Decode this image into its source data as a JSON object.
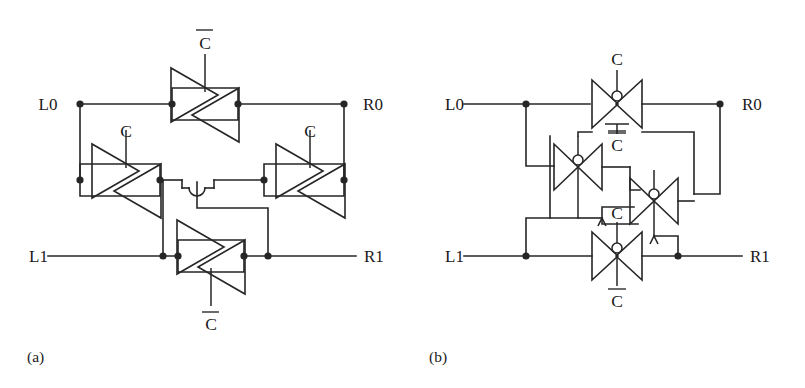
{
  "figure": {
    "kind": "circuit-schematic",
    "panels": [
      {
        "id": "a",
        "caption": "(a)",
        "style": "tri-state-buffer-pairs",
        "terminals": {
          "left_top": "L0",
          "right_top": "R0",
          "left_bottom": "L1",
          "right_bottom": "R1"
        },
        "devices": [
          {
            "id": "a-top",
            "control": "C̅",
            "control_plain": "Cbar",
            "position": "top-horizontal",
            "type": "back-to-back-tristate-buffers"
          },
          {
            "id": "a-left",
            "control": "C",
            "control_plain": "C",
            "position": "middle-left",
            "type": "back-to-back-tristate-buffers"
          },
          {
            "id": "a-right",
            "control": "C",
            "control_plain": "C",
            "position": "middle-right",
            "type": "back-to-back-tristate-buffers"
          },
          {
            "id": "a-bottom",
            "control": "C̅",
            "control_plain": "Cbar",
            "position": "bottom-horizontal",
            "type": "back-to-back-tristate-buffers"
          }
        ]
      },
      {
        "id": "b",
        "caption": "(b)",
        "style": "transmission-gates",
        "terminals": {
          "left_top": "L0",
          "right_top": "R0",
          "left_bottom": "L1",
          "right_bottom": "R1"
        },
        "devices": [
          {
            "id": "b-top",
            "control_top": "C",
            "control_bottom": "C̅",
            "position": "top-horizontal",
            "type": "cmos-transmission-gate"
          },
          {
            "id": "b-left",
            "control_top": "C̅",
            "control_bottom": "",
            "position": "middle-left",
            "type": "cmos-transmission-gate"
          },
          {
            "id": "b-right",
            "control_top": "",
            "control_bottom": "",
            "position": "middle-right",
            "type": "cmos-transmission-gate"
          },
          {
            "id": "b-bottom",
            "control_top": "C",
            "control_bottom": "C̅",
            "position": "bottom-horizontal",
            "type": "cmos-transmission-gate"
          }
        ]
      }
    ]
  },
  "labels": {
    "l0": "L0",
    "r0": "R0",
    "l1": "L1",
    "r1": "R1",
    "c": "C",
    "cbar": "C",
    "caption_a": "(a)",
    "caption_b": "(b)"
  },
  "colors": {
    "ink": "#262626",
    "text": "#1a1a1a",
    "background": "#ffffff"
  }
}
